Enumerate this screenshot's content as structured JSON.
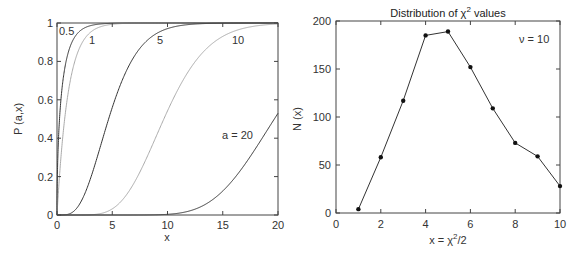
{
  "chart_data": [
    {
      "type": "line",
      "title": "",
      "xlabel": "x",
      "ylabel": "P (a,x)",
      "xlim": [
        0,
        20
      ],
      "ylim": [
        0,
        1
      ],
      "xticks": [
        "0",
        "5",
        "10",
        "15",
        "20"
      ],
      "yticks": [
        "0",
        "0.2",
        "0.4",
        "0.6",
        "0.8",
        "1"
      ],
      "grid": false,
      "legend": "none (inline curve labels)",
      "series": [
        {
          "name": "0.5",
          "a": 0.5,
          "color": "#333333",
          "label": "0.5"
        },
        {
          "name": "1",
          "a": 1,
          "color": "#aaaaaa",
          "label": "1"
        },
        {
          "name": "5",
          "a": 5,
          "color": "#333333",
          "label": "5"
        },
        {
          "name": "10",
          "a": 10,
          "color": "#aaaaaa",
          "label": "10"
        },
        {
          "name": "a = 20",
          "a": 20,
          "color": "#333333",
          "label": "a = 20"
        }
      ],
      "annotations": [
        "0.5",
        "1",
        "5",
        "10",
        "a = 20"
      ]
    },
    {
      "type": "line",
      "title": "Distribution of χ² values",
      "xlabel": "x = χ²/2",
      "ylabel": "N (x)",
      "xlim": [
        0,
        10
      ],
      "ylim": [
        0,
        200
      ],
      "xticks": [
        "0",
        "2",
        "4",
        "6",
        "8",
        "10"
      ],
      "yticks": [
        "0",
        "50",
        "100",
        "150",
        "200"
      ],
      "grid": false,
      "markers": true,
      "x": [
        1,
        2,
        3,
        4,
        5,
        6,
        7,
        8,
        9,
        10
      ],
      "series": [
        {
          "name": "N(x)",
          "values": [
            4,
            58,
            117,
            185,
            189,
            152,
            109,
            73,
            59,
            28
          ],
          "color": "#333333"
        }
      ],
      "annotations": [
        "ν = 10"
      ]
    }
  ],
  "left": {
    "ylabel": "P (a,x)",
    "xlabel": "x",
    "labels": {
      "a05": "0.5",
      "a1": "1",
      "a5": "5",
      "a10": "10",
      "a20": "a = 20"
    }
  },
  "right": {
    "title_prefix": "Distribution of χ",
    "title_sup": "2",
    "title_suffix": " values",
    "ylabel": "N (x)",
    "xlabel_prefix": "x = χ",
    "xlabel_sup": "2",
    "xlabel_suffix": "/2",
    "annotation": "ν = 10"
  }
}
